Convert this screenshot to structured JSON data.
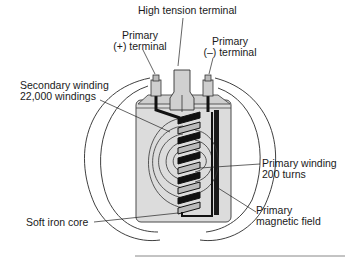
{
  "labels": {
    "high_tension_terminal": "High tension terminal",
    "primary_plus_line1": "Primary",
    "primary_plus_line2": "(+) terminal",
    "primary_minus_line1": "Primary",
    "primary_minus_line2": "(–) terminal",
    "secondary_winding_line1": "Secondary winding",
    "secondary_winding_line2": "22,000 windings",
    "primary_winding_line1": "Primary winding",
    "primary_winding_line2": "200 turns",
    "primary_field_line1": "Primary",
    "primary_field_line2": "magnetic field",
    "soft_iron_core": "Soft iron core"
  },
  "colors": {
    "line": "#2a2a2a",
    "body_fill": "#d9d9d9",
    "body_stroke": "#4a4a4a",
    "coil_dark": "#111111",
    "coil_light": "#bfbfbf"
  }
}
